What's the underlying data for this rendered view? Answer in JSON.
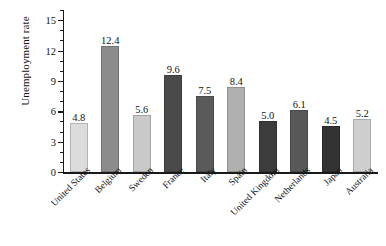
{
  "chart_data": {
    "type": "bar",
    "title": "",
    "xlabel": "",
    "ylabel": "Unemployment rate",
    "ylim": [
      0,
      16
    ],
    "ytick_labels": [
      "0",
      "3",
      "6",
      "9",
      "12",
      "15"
    ],
    "ytick_values": [
      0,
      3,
      6,
      9,
      12,
      15
    ],
    "yminor_step": 1,
    "grid": false,
    "legend": null,
    "categories": [
      "United States",
      "Belgium",
      "Sweden",
      "France",
      "Italy",
      "Spain",
      "United Kingdom",
      "Netherlands",
      "Japan",
      "Australia"
    ],
    "values": [
      4.8,
      12.4,
      5.6,
      9.6,
      7.5,
      8.4,
      5.0,
      6.1,
      4.5,
      5.2
    ],
    "value_labels": [
      "4.8",
      "12.4",
      "5.6",
      "9.6",
      "7.5",
      "8.4",
      "5.0",
      "6.1",
      "4.5",
      "5.2"
    ],
    "bar_colors": [
      "#dcdcdc",
      "#8c8c8c",
      "#c9c9c9",
      "#4a4a4a",
      "#5a5a5a",
      "#b0b0b0",
      "#3c3c3c",
      "#585858",
      "#333333",
      "#cfcfcf"
    ]
  },
  "axis": {
    "line_color": "#1a1a1a"
  }
}
